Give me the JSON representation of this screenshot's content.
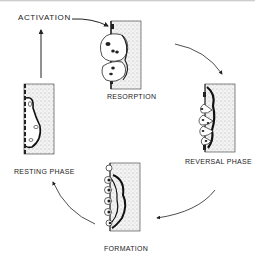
{
  "diagram": {
    "labels": {
      "activation": "ACTIVATION",
      "resorption": "RESORPTION",
      "reversal": "REVERSAL PHASE",
      "formation": "FORMATION",
      "resting": "RESTING PHASE"
    },
    "colors": {
      "ink": "#222222",
      "bone_stipple": "#dcdcdc",
      "background": "#ffffff"
    },
    "phases": [
      "ACTIVATION",
      "RESORPTION",
      "REVERSAL PHASE",
      "FORMATION",
      "RESTING PHASE"
    ],
    "cycle_direction": "clockwise"
  }
}
